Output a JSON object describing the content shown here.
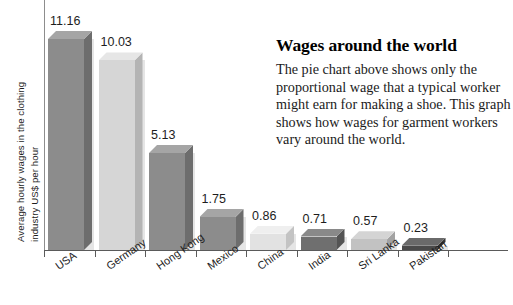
{
  "chart_data": {
    "type": "bar",
    "title": "",
    "xlabel": "",
    "ylabel": "Average hourly wages in the clothing industry US$ per hour",
    "ylabel_line1": "Average hourly wages in the clothing",
    "ylabel_line2": "industry US$ per hour",
    "ylim": [
      0,
      11.8
    ],
    "grid": false,
    "legend": "none",
    "categories": [
      "USA",
      "Germany",
      "Hong Kong",
      "Mexico",
      "China",
      "India",
      "Sri Lanka",
      "Pakistan"
    ],
    "values": [
      11.16,
      10.03,
      5.13,
      1.75,
      0.86,
      0.71,
      0.57,
      0.23
    ],
    "value_labels": [
      "11.16",
      "10.03",
      "5.13",
      "1.75",
      "0.86",
      "0.71",
      "0.57",
      "0.23"
    ],
    "bar_colors": [
      "#8c8c8c",
      "#d6d6d6",
      "#8c8c8c",
      "#8c8c8c",
      "#e2e2e2",
      "#6f6f6f",
      "#c2c2c2",
      "#4a4a4a"
    ],
    "bar_side_colors": [
      "#6d6d6d",
      "#b4b4b4",
      "#6d6d6d",
      "#6d6d6d",
      "#c3c3c3",
      "#545454",
      "#a2a2a2",
      "#343434"
    ],
    "bar_top_colors": [
      "#a5a5a5",
      "#e6e6e6",
      "#a5a5a5",
      "#a5a5a5",
      "#efefef",
      "#898989",
      "#d4d4d4",
      "#6a6a6a"
    ],
    "axis_color": "#5a5a5a"
  },
  "sidebox": {
    "title": "Wages around the world",
    "body": "The pie chart above shows only the proportional wage that a typical worker might earn for making a shoe. This graph shows how wages for garment workers vary around the world."
  }
}
